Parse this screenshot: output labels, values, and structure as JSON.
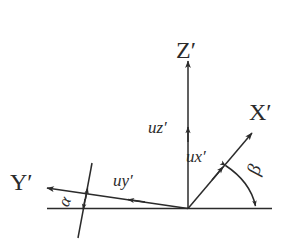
{
  "figure": {
    "kind": "coordinate-axes-diagram",
    "background_color": "#ffffff",
    "stroke_color": "#2b2b2b",
    "width": 288,
    "height": 240
  },
  "axes": {
    "z": {
      "label": "Z′",
      "direction": "vertical-up"
    },
    "x": {
      "label": "X′",
      "direction": "up-right-diagonal"
    },
    "y": {
      "label": "Y′",
      "direction": "left-slightly-up"
    }
  },
  "unit_vectors": {
    "uz": {
      "label": "uz′",
      "along_axis": "Z′"
    },
    "ux": {
      "label": "ux′",
      "along_axis": "X′"
    },
    "uy": {
      "label": "uy′",
      "along_axis": "Y′"
    }
  },
  "angles": {
    "alpha": {
      "label": "α",
      "between": "Y′ axis and horizontal reference line"
    },
    "beta": {
      "label": "β",
      "between": "X′ axis and horizontal reference line"
    }
  },
  "reference_line": {
    "label": "horizontal-reference-line"
  }
}
